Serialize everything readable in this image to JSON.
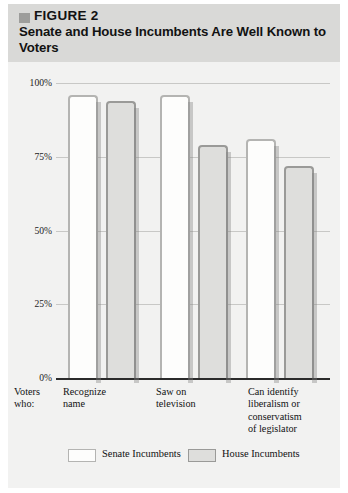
{
  "figure": {
    "marker_icon": "gray-square-icon",
    "label": "FIGURE 2",
    "title": "Senate and House Incumbents Are Well Known to Voters"
  },
  "axis": {
    "y_ticks": [
      "100%",
      "75%",
      "50%",
      "25%",
      "0%"
    ],
    "x_prefix_line1": "Voters",
    "x_prefix_line2": "who:"
  },
  "legend": {
    "items": [
      {
        "label": "Senate Incumbents",
        "key": "senate",
        "color": "#fdfdfc"
      },
      {
        "label": "House Incumbents",
        "key": "house",
        "color": "#dededc"
      }
    ]
  },
  "chart_data": {
    "type": "bar",
    "title": "Senate and House Incumbents Are Well Known to Voters",
    "xlabel": "Voters who:",
    "ylabel": "",
    "ylim": [
      0,
      100
    ],
    "yticks": [
      0,
      25,
      50,
      75,
      100
    ],
    "ytick_labels": [
      "0%",
      "25%",
      "50%",
      "75%",
      "100%"
    ],
    "grid": true,
    "legend_position": "bottom",
    "categories": [
      "Recognize name",
      "Saw on television",
      "Can identify liberalism or conservatism of legislator"
    ],
    "category_lines": [
      [
        "Recognize",
        "name"
      ],
      [
        "Saw on",
        "television"
      ],
      [
        "Can identify",
        "liberalism or",
        "conservatism",
        "of legislator"
      ]
    ],
    "series": [
      {
        "name": "Senate Incumbents",
        "values": [
          96,
          96,
          81
        ]
      },
      {
        "name": "House Incumbents",
        "values": [
          94,
          79,
          72
        ]
      }
    ]
  },
  "colors": {
    "panel_background": "#f2f2f1",
    "header_band": "#d9d9d7",
    "senate_fill": "#fdfdfc",
    "senate_stroke": "#b4b4b2",
    "house_fill": "#dededc",
    "house_stroke": "#9a9a98",
    "gridline": "#c8c8c6",
    "axis": "#2b2b2b",
    "text": "#111111"
  }
}
